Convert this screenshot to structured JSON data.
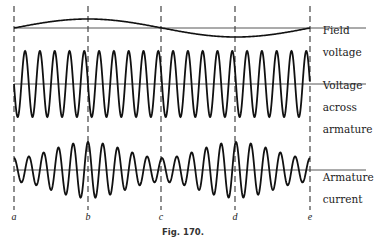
{
  "figure": {
    "caption": "Fig. 170.",
    "markers": [
      {
        "label": "a",
        "x": 14
      },
      {
        "label": "b",
        "x": 88
      },
      {
        "label": "c",
        "x": 161
      },
      {
        "label": "d",
        "x": 235
      },
      {
        "label": "e",
        "x": 310
      }
    ],
    "traces": [
      {
        "id": "field",
        "label_lines": [
          "Field",
          "voltage"
        ]
      },
      {
        "id": "armature-voltage",
        "label_lines": [
          "Voltage",
          "across",
          "armature"
        ]
      },
      {
        "id": "armature-current",
        "label_lines": [
          "Armature",
          "current"
        ]
      }
    ],
    "line_color": "#111111"
  },
  "chart_data": {
    "type": "line",
    "title": "Fig. 170.",
    "xlabel": "",
    "ylabel": "",
    "x_ticks": [
      "a",
      "b",
      "c",
      "d",
      "e"
    ],
    "grid": false,
    "series": [
      {
        "name": "Field voltage",
        "description": "Slow sinusoid, one full cycle from a to e: zero at a, positive max at b, zero at c, negative min at d, zero at e",
        "values_at_ticks": [
          0,
          1,
          0,
          -1,
          0
        ],
        "cycles_a_to_e": 1
      },
      {
        "name": "Voltage across armature",
        "description": "Constant-amplitude high-frequency sinusoid",
        "amplitude_relative": 1.0,
        "cycles_a_to_e": 20
      },
      {
        "name": "Armature current",
        "description": "High-frequency sinusoid with amplitude modulated at twice field frequency: minimum at a, c, e; maximum at b, d",
        "amplitude_at_ticks": [
          0.45,
          1.0,
          0.45,
          1.0,
          0.45
        ],
        "cycles_a_to_e": 20
      }
    ]
  }
}
